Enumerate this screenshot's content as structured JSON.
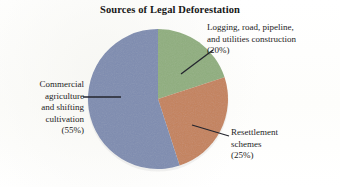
{
  "chart_data": {
    "type": "pie",
    "title": "Sources of Legal Deforestation",
    "xlabel": "",
    "ylabel": "",
    "legend_position": "callout-labels",
    "grid": false,
    "start_angle_deg": 0,
    "direction": "clockwise",
    "categories": [
      "Logging, road, pipeline, and utilities construction",
      "Resettlement schemes",
      "Commercial agriculture and shifting cultivation"
    ],
    "values": [
      20,
      25,
      55
    ],
    "value_unit": "percent",
    "colors": [
      "#8fae7e",
      "#c4825c",
      "#7e8cb0"
    ],
    "slices": [
      {
        "name": "Logging, road, pipeline, and utilities construction",
        "value": 20,
        "value_label": "(20%)",
        "color": "#8fae7e",
        "start_deg": 0,
        "end_deg": 72
      },
      {
        "name": "Resettlement schemes",
        "value": 25,
        "value_label": "(25%)",
        "color": "#c4825c",
        "start_deg": 72,
        "end_deg": 162
      },
      {
        "name": "Commercial agriculture and shifting cultivation",
        "value": 55,
        "value_label": "(55%)",
        "color": "#7e8cb0",
        "start_deg": 162,
        "end_deg": 360
      }
    ]
  },
  "title": "Sources of Legal Deforestation",
  "labels": {
    "commercial": {
      "line1": "Commercial",
      "line2": "agriculture",
      "line3": "and shifting",
      "line4": "cultivation",
      "percent": "(55%)"
    },
    "logging": {
      "line1": "Logging, road, pipeline,",
      "line2": "and utilities construction",
      "percent": "(20%)"
    },
    "resettlement": {
      "line1": "Resettlement",
      "line2": "schemes",
      "percent": "(25%)"
    }
  },
  "colors": {
    "green": "#8fae7e",
    "orange": "#c4825c",
    "blue": "#7e8cb0",
    "leader_line": "#23252e",
    "background": "#ffffff",
    "text": "#1d1d1d"
  }
}
